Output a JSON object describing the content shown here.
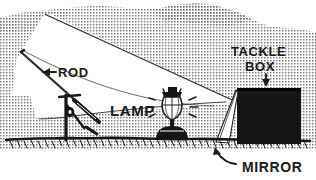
{
  "illustration": {
    "title": "Fishing rod, lamp, mirror and tackle box night-fishing setup",
    "style": "halftone-stipple-line-art",
    "colors": {
      "ink": "#1a1a1a",
      "paper": "#ffffff",
      "stipple": "#8f8f8f",
      "box_fill": "#151515"
    },
    "labels": [
      {
        "id": "rod",
        "text": "ROD",
        "arrow": "left-arrow",
        "x": 58,
        "y": 74,
        "size": 11
      },
      {
        "id": "lamp",
        "text": "LAMP",
        "arrow": "none",
        "x": 112,
        "y": 114,
        "size": 13
      },
      {
        "id": "tackle-box-line1",
        "text": "TACKLE",
        "arrow": "down-arrow",
        "x": 232,
        "y": 54,
        "size": 11
      },
      {
        "id": "tackle-box-line2",
        "text": "BOX",
        "arrow": "none",
        "x": 247,
        "y": 68,
        "size": 11
      },
      {
        "id": "mirror",
        "text": "MIRROR",
        "arrow": "curved-left-arrow",
        "x": 243,
        "y": 172,
        "size": 12
      }
    ],
    "objects": [
      {
        "id": "fishing-rod",
        "name": "fishing rod"
      },
      {
        "id": "rod-holder",
        "name": "rod holder stand"
      },
      {
        "id": "lantern",
        "name": "lantern lamp with rays"
      },
      {
        "id": "mirror-panel",
        "name": "angled mirror panel"
      },
      {
        "id": "tackle-box",
        "name": "tackle box"
      },
      {
        "id": "ground",
        "name": "ground line with grass"
      },
      {
        "id": "light-beam",
        "name": "reflected light beam wedge"
      }
    ]
  }
}
